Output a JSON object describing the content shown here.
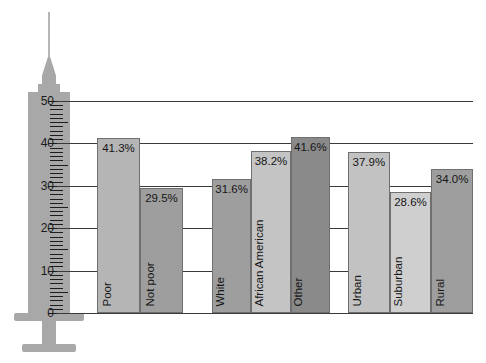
{
  "chart_data": {
    "type": "bar",
    "title": "",
    "subtitle": "",
    "xlabel": "",
    "ylabel": "",
    "ylim": [
      0,
      50
    ],
    "yticks": [
      0,
      10,
      20,
      30,
      40,
      50
    ],
    "ytick_labels": [
      "0",
      "10",
      "20",
      "30",
      "40",
      "50"
    ],
    "grid": true,
    "legend": "none",
    "y_axis_style": "syringe-graduated-scale",
    "value_label_format": "percent-one-decimal",
    "groups": [
      {
        "name": "poverty-status",
        "bars": [
          {
            "category": "Poor",
            "value": 41.3,
            "label": "41.3%",
            "color": "#b5b5b5"
          },
          {
            "category": "Not poor",
            "value": 29.5,
            "label": "29.5%",
            "color": "#9e9e9e"
          }
        ]
      },
      {
        "name": "race-ethnicity",
        "bars": [
          {
            "category": "White",
            "value": 31.6,
            "label": "31.6%",
            "color": "#9e9e9e"
          },
          {
            "category": "African American",
            "value": 38.2,
            "label": "38.2%",
            "color": "#c4c4c4"
          },
          {
            "category": "Other",
            "value": 41.6,
            "label": "41.6%",
            "color": "#8a8a8a"
          }
        ]
      },
      {
        "name": "residence",
        "bars": [
          {
            "category": "Urban",
            "value": 37.9,
            "label": "37.9%",
            "color": "#c2c2c2"
          },
          {
            "category": "Suburban",
            "value": 28.6,
            "label": "28.6%",
            "color": "#cfcfcf"
          },
          {
            "category": "Rural",
            "value": 34.0,
            "label": "34.0%",
            "color": "#9e9e9e"
          }
        ]
      }
    ],
    "categories": [
      "Poor",
      "Not poor",
      "White",
      "African American",
      "Other",
      "Urban",
      "Suburban",
      "Rural"
    ],
    "values": [
      41.3,
      29.5,
      31.6,
      38.2,
      41.6,
      37.9,
      28.6,
      34.0
    ]
  },
  "axis": {
    "gridline_color": "#3a3a3a",
    "syringe_color": "#a8a8a8",
    "tick_color": "#1d1d1d"
  }
}
